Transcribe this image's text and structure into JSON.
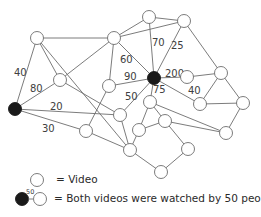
{
  "legend": {
    "video_label": "= Video",
    "edge_example_weight": "50",
    "edge_label": "= Both videos were watched by 50 people"
  },
  "graph": {
    "nodes": [
      {
        "id": "A",
        "x": 15,
        "y": 109,
        "filled": true
      },
      {
        "id": "B",
        "x": 154,
        "y": 78,
        "filled": true
      },
      {
        "id": "n1",
        "x": 37,
        "y": 38,
        "filled": false
      },
      {
        "id": "n2",
        "x": 114,
        "y": 38,
        "filled": false
      },
      {
        "id": "n3",
        "x": 149,
        "y": 17,
        "filled": false
      },
      {
        "id": "n4",
        "x": 184,
        "y": 21,
        "filled": false
      },
      {
        "id": "n5",
        "x": 60,
        "y": 80,
        "filled": false
      },
      {
        "id": "n6",
        "x": 109,
        "y": 86,
        "filled": false
      },
      {
        "id": "n7",
        "x": 120,
        "y": 115,
        "filled": false
      },
      {
        "id": "n8",
        "x": 187,
        "y": 77,
        "filled": false
      },
      {
        "id": "n9",
        "x": 221,
        "y": 73,
        "filled": false
      },
      {
        "id": "n10",
        "x": 200,
        "y": 104,
        "filled": false
      },
      {
        "id": "n11",
        "x": 243,
        "y": 103,
        "filled": false
      },
      {
        "id": "n12",
        "x": 86,
        "y": 131,
        "filled": false
      },
      {
        "id": "n13",
        "x": 150,
        "y": 102,
        "filled": false
      },
      {
        "id": "n14",
        "x": 165,
        "y": 121,
        "filled": false
      },
      {
        "id": "n15",
        "x": 139,
        "y": 130,
        "filled": false
      },
      {
        "id": "n16",
        "x": 130,
        "y": 150,
        "filled": false
      },
      {
        "id": "n17",
        "x": 226,
        "y": 133,
        "filled": false
      },
      {
        "id": "n18",
        "x": 188,
        "y": 149,
        "filled": false
      },
      {
        "id": "n19",
        "x": 161,
        "y": 172,
        "filled": false
      }
    ],
    "edges": [
      {
        "from": "A",
        "to": "n1",
        "label": "40",
        "lx": 14,
        "ly": 76
      },
      {
        "from": "A",
        "to": "n5",
        "label": "80",
        "lx": 30,
        "ly": 92
      },
      {
        "from": "A",
        "to": "n7",
        "label": "20",
        "lx": 50,
        "ly": 110
      },
      {
        "from": "A",
        "to": "n12",
        "label": "30",
        "lx": 42,
        "ly": 132
      },
      {
        "from": "n1",
        "to": "n2",
        "label": ""
      },
      {
        "from": "n1",
        "to": "n5",
        "label": ""
      },
      {
        "from": "n1",
        "to": "n16",
        "label": ""
      },
      {
        "from": "n5",
        "to": "n2",
        "label": ""
      },
      {
        "from": "n5",
        "to": "n7",
        "label": ""
      },
      {
        "from": "n2",
        "to": "n3",
        "label": ""
      },
      {
        "from": "n2",
        "to": "n4",
        "label": ""
      },
      {
        "from": "n2",
        "to": "n6",
        "label": ""
      },
      {
        "from": "n2",
        "to": "B",
        "label": "60",
        "lx": 120,
        "ly": 63
      },
      {
        "from": "n3",
        "to": "n4",
        "label": ""
      },
      {
        "from": "n3",
        "to": "B",
        "label": "70",
        "lx": 152,
        "ly": 46
      },
      {
        "from": "n4",
        "to": "B",
        "label": "25",
        "lx": 171,
        "ly": 49
      },
      {
        "from": "n4",
        "to": "n9",
        "label": ""
      },
      {
        "from": "n6",
        "to": "B",
        "label": "90",
        "lx": 124,
        "ly": 80
      },
      {
        "from": "n6",
        "to": "n12",
        "label": ""
      },
      {
        "from": "n7",
        "to": "B",
        "label": "50",
        "lx": 125,
        "ly": 100
      },
      {
        "from": "n7",
        "to": "n16",
        "label": ""
      },
      {
        "from": "B",
        "to": "n8",
        "label": "200",
        "lx": 165,
        "ly": 77
      },
      {
        "from": "B",
        "to": "n13",
        "label": "75",
        "lx": 153,
        "ly": 93
      },
      {
        "from": "B",
        "to": "n10",
        "label": ""
      },
      {
        "from": "n8",
        "to": "n9",
        "label": "40",
        "lx": 188,
        "ly": 94
      },
      {
        "from": "n9",
        "to": "n10",
        "label": ""
      },
      {
        "from": "n9",
        "to": "n11",
        "label": ""
      },
      {
        "from": "n10",
        "to": "n11",
        "label": ""
      },
      {
        "from": "n11",
        "to": "n17",
        "label": ""
      },
      {
        "from": "n13",
        "to": "n15",
        "label": ""
      },
      {
        "from": "n13",
        "to": "n14",
        "label": ""
      },
      {
        "from": "n13",
        "to": "n17",
        "label": ""
      },
      {
        "from": "n14",
        "to": "n15",
        "label": ""
      },
      {
        "from": "n14",
        "to": "n17",
        "label": ""
      },
      {
        "from": "n14",
        "to": "n18",
        "label": ""
      },
      {
        "from": "n15",
        "to": "n16",
        "label": ""
      },
      {
        "from": "n12",
        "to": "n16",
        "label": ""
      },
      {
        "from": "n16",
        "to": "n19",
        "label": ""
      },
      {
        "from": "n18",
        "to": "n19",
        "label": ""
      }
    ]
  }
}
